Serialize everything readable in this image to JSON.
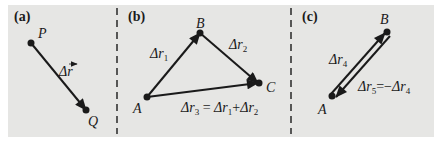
{
  "figure": {
    "background_color": "#e6e6e4",
    "ink_color": "#1a1a1a",
    "panels": [
      {
        "id": "a",
        "label": "(a)",
        "points": [
          {
            "name": "P"
          },
          {
            "name": "Q"
          }
        ],
        "vectors": [
          {
            "symbol": "Δr⃗",
            "text": "Δ",
            "var": "r",
            "from": "P",
            "to": "Q"
          }
        ]
      },
      {
        "id": "b",
        "label": "(b)",
        "points": [
          {
            "name": "A"
          },
          {
            "name": "B"
          },
          {
            "name": "C"
          }
        ],
        "vectors": [
          {
            "text": "Δ",
            "var": "r",
            "sub": "1",
            "from": "A",
            "to": "B"
          },
          {
            "text": "Δ",
            "var": "r",
            "sub": "2",
            "from": "B",
            "to": "C"
          },
          {
            "text": "Δ",
            "var": "r",
            "sub": "3",
            "from": "A",
            "to": "C"
          }
        ],
        "equation": {
          "lhs": {
            "text": "Δ",
            "var": "r",
            "sub": "3"
          },
          "eq": "=",
          "t1": {
            "text": "Δ",
            "var": "r",
            "sub": "1"
          },
          "op": "+",
          "t2": {
            "text": "Δ",
            "var": "r",
            "sub": "2"
          }
        }
      },
      {
        "id": "c",
        "label": "(c)",
        "points": [
          {
            "name": "A"
          },
          {
            "name": "B"
          }
        ],
        "vectors": [
          {
            "text": "Δ",
            "var": "r",
            "sub": "4",
            "from": "A",
            "to": "B"
          },
          {
            "text": "Δ",
            "var": "r",
            "sub": "5",
            "from": "B",
            "to": "A"
          }
        ],
        "equation": {
          "lhs": {
            "text": "Δ",
            "var": "r",
            "sub": "5"
          },
          "eq": "=",
          "neg": "−",
          "rhs": {
            "text": "Δ",
            "var": "r",
            "sub": "4"
          }
        }
      }
    ]
  }
}
